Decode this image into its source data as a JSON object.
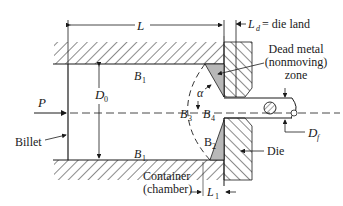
{
  "figure": {
    "labels": {
      "L": "L",
      "Ld_symbol": "L",
      "Ld_sub": "d",
      "Ld_text": "= die land",
      "B1_top": "B",
      "B1_top_sub": "1",
      "B1_bottom": "B",
      "B1_bottom_sub": "1",
      "D0": "D",
      "D0_sub": "0",
      "P": "P",
      "billet": "Billet",
      "alpha": "α",
      "B3": "B",
      "B3_sub": "3",
      "B4": "B",
      "B4_sub": "4",
      "B2": "B",
      "B2_sub": "2",
      "dead_metal_line1": "Dead metal",
      "dead_metal_line2": "(nonmoving)",
      "dead_metal_line3": "zone",
      "Df": "D",
      "Df_sub": "f",
      "die": "Die",
      "container_line1": "Container",
      "container_line2": "(chamber)",
      "L1": "L",
      "L1_sub": "1"
    },
    "colors": {
      "line": "#1a1a1a",
      "dead_zone_fill": "#b8b8b8",
      "background": "#ffffff"
    }
  }
}
